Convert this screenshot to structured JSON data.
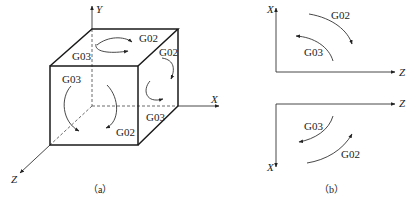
{
  "figure": {
    "panel_a": {
      "caption": "（a）",
      "axes": {
        "x": "X",
        "y": "Y",
        "z": "Z"
      },
      "labels": {
        "top_g02": "G02",
        "top_g03": "G03",
        "right_g02": "G02",
        "right_g03": "G03",
        "front_g03": "G03",
        "front_g02": "G02"
      }
    },
    "panel_b": {
      "caption": "（b）",
      "upper": {
        "axis_vertical": "X",
        "axis_horizontal": "Z",
        "g02": "G02",
        "g03": "G03"
      },
      "lower": {
        "axis_vertical": "X",
        "axis_horizontal": "Z",
        "g02": "G02",
        "g03": "G03"
      }
    }
  }
}
